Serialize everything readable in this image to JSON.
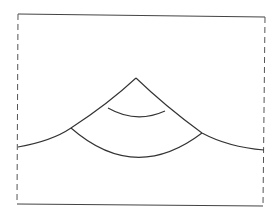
{
  "diagram": {
    "stroke_color": "#333333",
    "frame": {
      "top_left": [
        18,
        14
      ],
      "top_right": [
        265,
        17
      ],
      "bottom_left": [
        17,
        204
      ],
      "bottom_right": [
        263,
        206
      ],
      "left_side_style": "dashed",
      "right_side_style": "dashed",
      "top_style": "solid",
      "bottom_style": "solid"
    },
    "peak": [
      136,
      78
    ],
    "left_curve_end": [
      18,
      147
    ],
    "right_curve_end": [
      264,
      150
    ],
    "inner_arc": {
      "from": [
        108,
        108
      ],
      "to": [
        165,
        111
      ],
      "lowest_y": 116
    },
    "outer_arc": {
      "from": [
        71,
        128
      ],
      "to": [
        202,
        133
      ],
      "lowest_y": 155
    }
  }
}
